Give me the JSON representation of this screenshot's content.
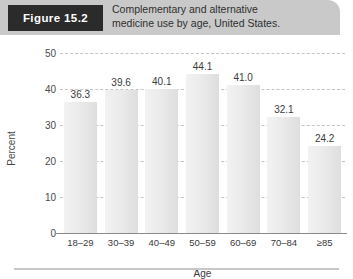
{
  "figure": {
    "badge_label": "Figure 15.2",
    "caption_line1": "Complementary and alternative",
    "caption_line2": "medicine use by age, United States."
  },
  "chart_data": {
    "type": "bar",
    "title": "Complementary and alternative medicine use by age, United States.",
    "xlabel": "Age",
    "ylabel": "Percent",
    "categories": [
      "18–29",
      "30–39",
      "40–49",
      "50–59",
      "60–69",
      "70–84",
      "≥85"
    ],
    "values": [
      36.3,
      39.6,
      40.1,
      44.1,
      41.0,
      32.1,
      24.2
    ],
    "value_labels": [
      "36.3",
      "39.6",
      "40.1",
      "44.1",
      "41.0",
      "32.1",
      "24.2"
    ],
    "ylim": [
      0,
      50
    ],
    "yticks": [
      0,
      10,
      20,
      30,
      40,
      50
    ],
    "ytick_labels": [
      "0",
      "10",
      "20",
      "30",
      "40",
      "50"
    ],
    "grid": true,
    "legend": "none",
    "bar_color": "#e9e9e9",
    "grid_color": "#c4c4c4",
    "axis_color": "#8a8a8a"
  }
}
